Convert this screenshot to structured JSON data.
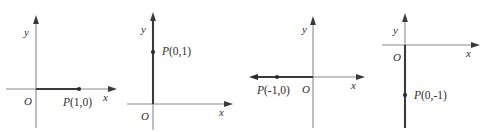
{
  "figure": {
    "width": 492,
    "height": 132,
    "background_color": "#ffffff",
    "axis_color": "#8a8a8a",
    "highlight_color": "#3a3a3a",
    "text_color": "#2e2e2e"
  },
  "panels": [
    {
      "id": "panel-1",
      "origin_label": "O",
      "x_axis_label": "x",
      "y_axis_label": "y",
      "point_label": "P(1,0)",
      "point_label_prefix": "P",
      "point_label_coords": "(1,0)",
      "point_x": 1,
      "point_y": 0,
      "vector_direction": "positive-x"
    },
    {
      "id": "panel-2",
      "origin_label": "O",
      "x_axis_label": "x",
      "y_axis_label": "y",
      "point_label": "P(0,1)",
      "point_label_prefix": "P",
      "point_label_coords": "(0,1)",
      "point_x": 0,
      "point_y": 1,
      "vector_direction": "positive-y"
    },
    {
      "id": "panel-3",
      "origin_label": "O",
      "x_axis_label": "x",
      "y_axis_label": "y",
      "point_label": "P(-1,0)",
      "point_label_prefix": "P",
      "point_label_coords": "(-1,0)",
      "point_x": -1,
      "point_y": 0,
      "vector_direction": "negative-x"
    },
    {
      "id": "panel-4",
      "origin_label": "O",
      "x_axis_label": "x",
      "y_axis_label": "y",
      "point_label": "P(0,-1)",
      "point_label_prefix": "P",
      "point_label_coords": "(0,-1)",
      "point_x": 0,
      "point_y": -1,
      "vector_direction": "negative-y"
    }
  ]
}
